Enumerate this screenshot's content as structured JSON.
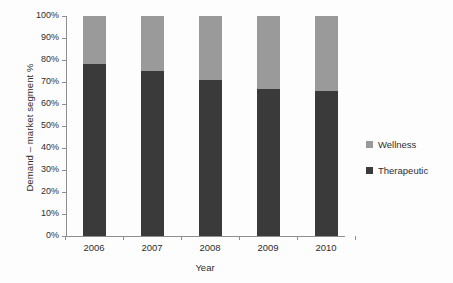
{
  "chart_data": {
    "type": "bar",
    "subtype": "stacked-100-percent",
    "title": "",
    "xlabel": "Year",
    "ylabel": "Demand – market segment %",
    "categories": [
      "2006",
      "2007",
      "2008",
      "2009",
      "2010"
    ],
    "ytick_labels": [
      "0%",
      "10%",
      "20%",
      "30%",
      "40%",
      "50%",
      "60%",
      "70%",
      "80%",
      "90%",
      "100%"
    ],
    "ytick_values": [
      0,
      10,
      20,
      30,
      40,
      50,
      60,
      70,
      80,
      90,
      100
    ],
    "ylim": [
      0,
      100
    ],
    "grid": false,
    "legend_position": "right",
    "series": [
      {
        "name": "Wellness",
        "color": "#9a9a9a",
        "values": [
          22,
          25,
          29,
          33,
          34
        ]
      },
      {
        "name": "Therapeutic",
        "color": "#3a3a3a",
        "values": [
          78,
          75,
          71,
          67,
          66
        ]
      }
    ],
    "legend_order": [
      "Wellness",
      "Therapeutic"
    ]
  },
  "legend": {
    "items": [
      {
        "label": "Wellness",
        "color": "#9a9a9a"
      },
      {
        "label": "Therapeutic",
        "color": "#3a3a3a"
      }
    ]
  }
}
